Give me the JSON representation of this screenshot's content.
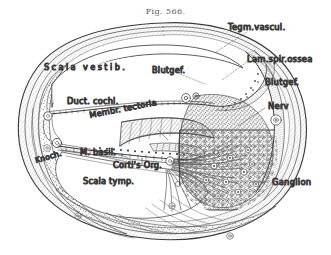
{
  "figure": {
    "title": "Fig. 566."
  },
  "labels": {
    "external": [
      {
        "id": "tegm-vascul",
        "text": "Tegm.vascul."
      },
      {
        "id": "lam-spir-ossea",
        "text": "Lam.spir.ossea"
      },
      {
        "id": "blutgef-right",
        "text": "Blutgef."
      },
      {
        "id": "nerv",
        "text": "Nerv"
      },
      {
        "id": "ganglion",
        "text": "Ganglion"
      }
    ],
    "internal": [
      {
        "id": "scala-vestib",
        "text": "Scala  vestib."
      },
      {
        "id": "blutgef-upper",
        "text": "Blutgef."
      },
      {
        "id": "duct-cochl",
        "text": "Duct. cochl."
      },
      {
        "id": "membr-tectoria",
        "text": "Membr. tectoria"
      },
      {
        "id": "m-basil",
        "text": "M. basil."
      },
      {
        "id": "cortis-org",
        "text": "Corti's Org."
      },
      {
        "id": "scala-tymp",
        "text": "Scala tymp."
      },
      {
        "id": "knoch",
        "text": "Knoch."
      }
    ]
  },
  "colors": {
    "ink": "#3a3a3a",
    "ink_dark": "#232323",
    "title": "#5a5a5a",
    "paper": "#ffffff",
    "hatch": "#6b6b6b",
    "stipple": "#5e5e5e"
  }
}
